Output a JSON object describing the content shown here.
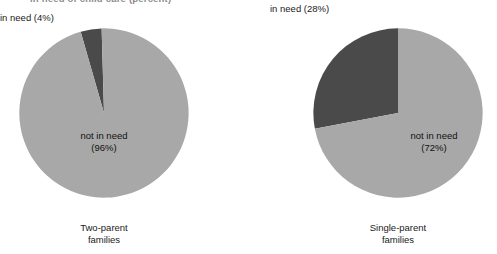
{
  "figure": {
    "title": "in need of child care (percent)",
    "background": "#ffffff",
    "colors": {
      "in_need": "#4a4a4a",
      "not_in_need": "#a8a8a8",
      "text": "#1a1a1a"
    }
  },
  "chart_data": {
    "type": "pie",
    "title": "in need of child care (percent)",
    "xlabel": "",
    "ylabel": "",
    "legend_position": "none",
    "grid": false,
    "charts": [
      {
        "caption_line1": "Two-parent",
        "caption_line2": "families",
        "categories": [
          "in need",
          "not in need"
        ],
        "values": [
          4,
          96
        ],
        "units": "percent",
        "callout_label": "in need (4%)",
        "inner_label_line1": "not in need",
        "inner_label_line2": "(96%)",
        "slice_colors": [
          "#4a4a4a",
          "#a8a8a8"
        ],
        "start_angle_deg": -16
      },
      {
        "caption_line1": "Single-parent",
        "caption_line2": "families",
        "categories": [
          "in need",
          "not in need"
        ],
        "values": [
          28,
          72
        ],
        "units": "percent",
        "callout_label": "in need (28%)",
        "inner_label_line1": "not in need",
        "inner_label_line2": "(72%)",
        "slice_colors": [
          "#4a4a4a",
          "#a8a8a8"
        ],
        "start_angle_deg": -100.8
      }
    ]
  }
}
